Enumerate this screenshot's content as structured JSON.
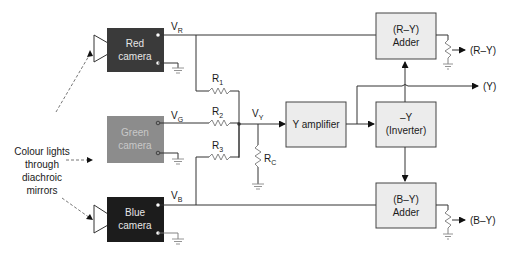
{
  "cameras": [
    {
      "id": "red",
      "line1": "Red",
      "line2": "camera",
      "fill": "#3a3a3a",
      "text_color": "#e6e6e6",
      "voltage": "V",
      "voltage_sub": "R"
    },
    {
      "id": "green",
      "line1": "Green",
      "line2": "camera",
      "fill": "#8c8c8c",
      "text_color": "#c8c8c8",
      "voltage": "V",
      "voltage_sub": "G"
    },
    {
      "id": "blue",
      "line1": "Blue",
      "line2": "camera",
      "fill": "#1c1c1c",
      "text_color": "#e6e6e6",
      "voltage": "V",
      "voltage_sub": "B"
    }
  ],
  "light_source": {
    "lines": [
      "Colour lights",
      "through",
      "diachroic",
      "mirrors"
    ]
  },
  "resistors": [
    {
      "name": "R",
      "sub": "1"
    },
    {
      "name": "R",
      "sub": "2"
    },
    {
      "name": "R",
      "sub": "3"
    },
    {
      "name": "R",
      "sub": "C"
    }
  ],
  "node": {
    "name": "V",
    "sub": "Y"
  },
  "blocks": {
    "y_amplifier": {
      "line1": "Y amplifier"
    },
    "inverter": {
      "line1": "–Y",
      "line2": "(Inverter)"
    },
    "ry_adder": {
      "line1": "(R–Y)",
      "line2": "Adder"
    },
    "by_adder": {
      "line1": "(B–Y)",
      "line2": "Adder"
    }
  },
  "outputs": {
    "ry": "(R–Y)",
    "y": "(Y)",
    "by": "(B–Y)"
  }
}
